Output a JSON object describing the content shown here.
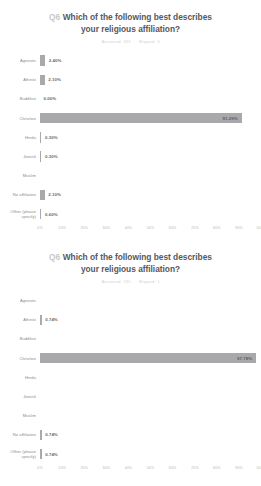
{
  "charts": [
    {
      "q_number": "Q6",
      "title_line1": "Which of the following best describes",
      "title_line2": "your religious affiliation?",
      "answered_label": "Answered: 333",
      "skipped_label": "Skipped: 4",
      "chart_data": {
        "type": "bar",
        "title": "Q6 Which of the following best describes your religious affiliation?",
        "xlabel": "",
        "ylabel": "",
        "xlim": [
          0,
          100
        ],
        "grid": false,
        "legend": "none",
        "orientation": "horizontal",
        "bar_color": "#a9a9ab",
        "categories": [
          "Agnostic",
          "Atheist",
          "Buddhist",
          "Christian",
          "Hindu",
          "Jewish",
          "Muslim",
          "No affiliation",
          "Other (please\nspecify)"
        ],
        "values": [
          2.4,
          2.1,
          0.0,
          91.29,
          0.3,
          0.3,
          0.0,
          2.1,
          0.6
        ],
        "value_labels": [
          "2.40%",
          "2.10%",
          "0.00%",
          "91.29%",
          "0.30%",
          "0.30%",
          "",
          "2.10%",
          "0.60%"
        ],
        "tick_labels": [
          "0%",
          "10%",
          "20%",
          "30%",
          "40%",
          "50%",
          "60%",
          "70%",
          "80%",
          "90%",
          "100%"
        ],
        "tick_values": [
          0,
          10,
          20,
          30,
          40,
          50,
          60,
          70,
          80,
          90,
          100
        ]
      }
    },
    {
      "q_number": "Q6",
      "title_line1": "Which of the following best describes",
      "title_line2": "your religious affiliation?",
      "answered_label": "Answered: 135",
      "skipped_label": "Skipped: 1",
      "chart_data": {
        "type": "bar",
        "title": "Q6 Which of the following best describes your religious affiliation?",
        "xlabel": "",
        "ylabel": "",
        "xlim": [
          0,
          100
        ],
        "grid": false,
        "legend": "none",
        "orientation": "horizontal",
        "bar_color": "#a9a9ab",
        "categories": [
          "Agnostic",
          "Atheist",
          "Buddhist",
          "Christian",
          "Hindu",
          "Jewish",
          "Muslim",
          "No affiliation",
          "Other (please\nspecify)"
        ],
        "values": [
          0.0,
          0.74,
          0.0,
          97.78,
          0.0,
          0.0,
          0.0,
          0.74,
          0.74
        ],
        "value_labels": [
          "",
          "0.74%",
          "",
          "97.78%",
          "",
          "",
          "",
          "0.74%",
          "0.74%"
        ],
        "tick_labels": [
          "0%",
          "10%",
          "20%",
          "30%",
          "40%",
          "50%",
          "60%",
          "70%",
          "80%",
          "90%",
          "100%"
        ],
        "tick_values": [
          0,
          10,
          20,
          30,
          40,
          50,
          60,
          70,
          80,
          90,
          100
        ]
      }
    }
  ]
}
